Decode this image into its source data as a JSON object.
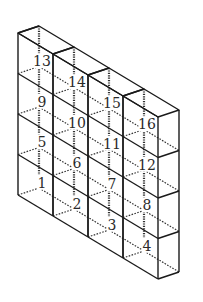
{
  "figure": {
    "columns": 4,
    "rows": 4,
    "labels_by_row_top_to_bottom": [
      [
        "13",
        "14",
        "15",
        "16"
      ],
      [
        "9",
        "10",
        "11",
        "12"
      ],
      [
        "5",
        "6",
        "7",
        "8"
      ],
      [
        "1",
        "2",
        "3",
        "4"
      ]
    ],
    "line_color": "#1a1a1a",
    "background": "#ffffff"
  }
}
